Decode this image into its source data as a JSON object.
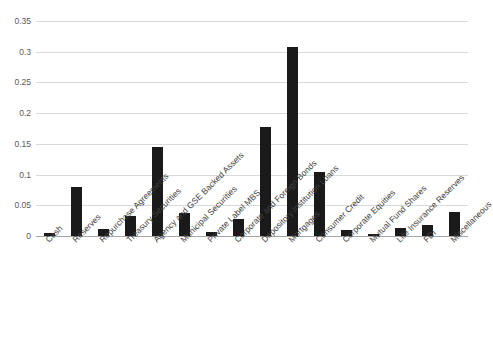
{
  "chart_data": {
    "type": "bar",
    "title": "",
    "subtitle": "",
    "xlabel": "",
    "ylabel": "",
    "ylim": [
      0,
      0.35
    ],
    "grid": true,
    "legend": false,
    "y_ticks": [
      "0",
      "0.05",
      "0.1",
      "0.15",
      "0.2",
      "0.25",
      "0.3",
      "0.35"
    ],
    "y_tick_values": [
      0,
      0.05,
      0.1,
      0.15,
      0.2,
      0.25,
      0.3,
      0.35
    ],
    "bar_color": "#1a1a1a",
    "gridline_color": "#d9d9d9",
    "axis_color": "#a6a6a6",
    "categories": [
      "Cash",
      "Reserves",
      "Repurchase Agreements",
      "Treasury Securities",
      "Agency and GSE Backed Assets",
      "Municipal Securities",
      "Private Label MBS",
      "Corporate and Foreign Bonds",
      "Depository Institution Loans",
      "Mortgages",
      "Consumer Credit",
      "Corporate Equities",
      "Mutual Fund Shares",
      "Life Insurance Reserves",
      "FDI",
      "Miscellaneous"
    ],
    "values": [
      0.005,
      0.08,
      0.012,
      0.032,
      0.145,
      0.037,
      0.006,
      0.027,
      0.178,
      0.307,
      0.105,
      0.009,
      0.003,
      0.013,
      0.018,
      0.039
    ]
  }
}
